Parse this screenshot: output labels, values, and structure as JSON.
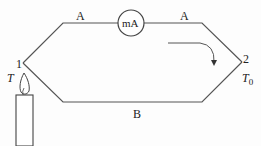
{
  "diagram": {
    "wire_top_left_label": "A",
    "wire_top_right_label": "A",
    "wire_bottom_label": "B",
    "meter_label": "mA",
    "junction_left_label": "1",
    "junction_right_label": "2",
    "temp_hot_label": "T",
    "temp_cold_label": "T",
    "temp_cold_subscript": "0",
    "current_direction": "clockwise",
    "heat_source": "candle",
    "line_color": "#555555"
  }
}
